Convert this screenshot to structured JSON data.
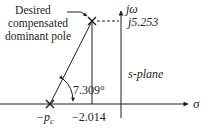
{
  "diagram": {
    "type": "s-plane pole diagram",
    "plane_label": "s-plane",
    "axes": {
      "real_axis_label": "σ",
      "imag_axis_label": "jω"
    },
    "annotation": {
      "line1": "Desired",
      "line2": "compensated",
      "line3": "dominant pole"
    },
    "pole_imag_label": "j5.253",
    "pole_real_label": "−2.014",
    "compensator_pole_label_main": "−p",
    "compensator_pole_label_sub": "c",
    "angle_label": "7.309°",
    "colors": {
      "ink": "#231f20",
      "background": "#ffffff"
    }
  }
}
